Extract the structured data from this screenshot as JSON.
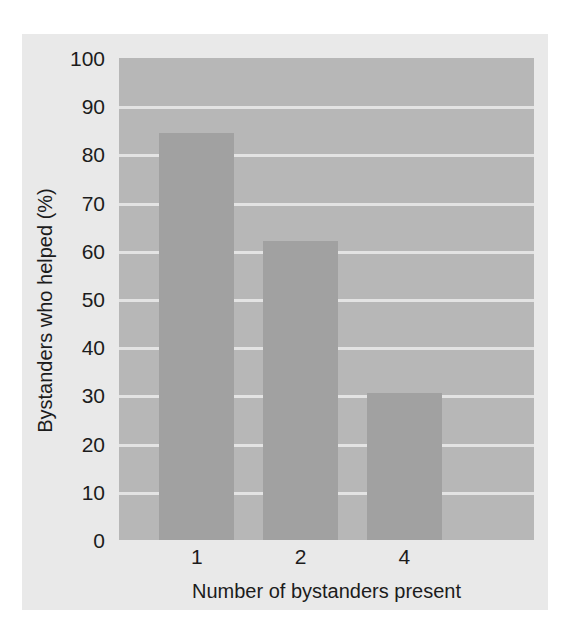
{
  "chart_data": {
    "type": "bar",
    "title": "",
    "categories": [
      "1",
      "2",
      "4"
    ],
    "values": [
      84.5,
      62,
      30.5
    ],
    "series": [
      {
        "name": "Bystanders who helped (%)",
        "values": [
          84.5,
          62,
          30.5
        ]
      }
    ],
    "xlabel": "Number of bystanders present",
    "ylabel": "Bystanders who helped (%)",
    "ylim": [
      0,
      100
    ],
    "yticks": [
      0,
      10,
      20,
      30,
      40,
      50,
      60,
      70,
      80,
      90,
      100
    ],
    "ytick_labels": [
      "0",
      "10",
      "20",
      "30",
      "40",
      "50",
      "60",
      "70",
      "80",
      "90",
      "100"
    ],
    "grid": true,
    "grid_axis": "y",
    "legend": false,
    "legend_position": "none",
    "colors": {
      "bar": "#a1a1a1",
      "plot_background": "#b7b7b7",
      "figure_background": "#e9e9e9",
      "gridline": "#e3e3e3",
      "text": "#1c1c1c"
    }
  }
}
